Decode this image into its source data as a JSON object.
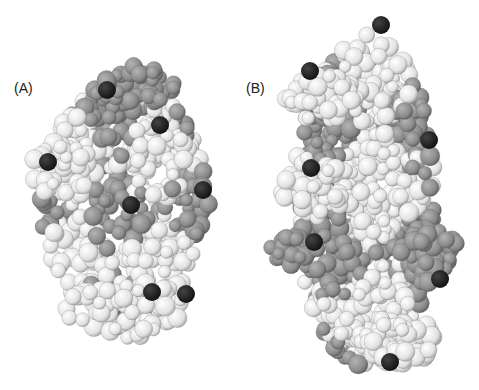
{
  "figure": {
    "panels": [
      {
        "label": "(A)",
        "description": "space-filling molecular model, compact globular view"
      },
      {
        "label": "(B)",
        "description": "space-filling molecular model, elongated view"
      }
    ],
    "colors": {
      "light_atoms": "#e8e8e8",
      "medium_atoms": "#8c8c8c",
      "dark_atoms": "#1e1e1e",
      "background": "#ffffff"
    }
  }
}
